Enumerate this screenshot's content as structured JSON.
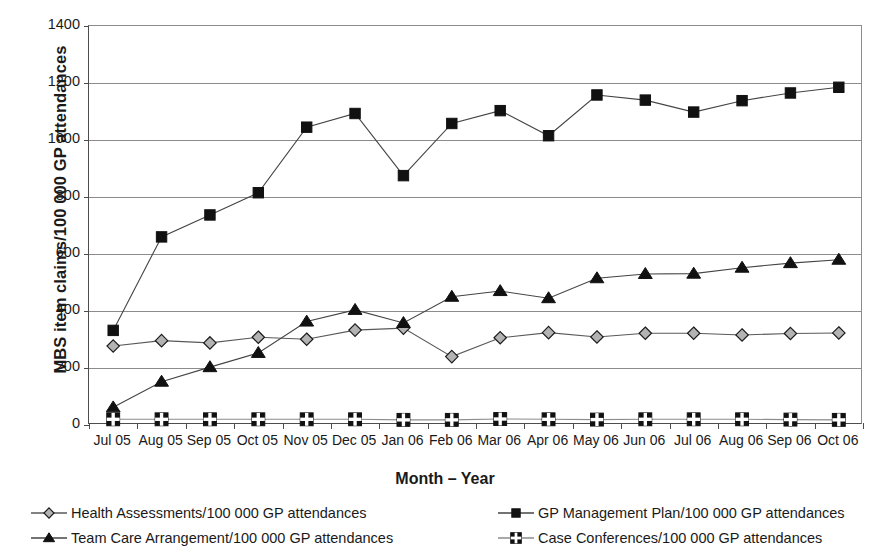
{
  "chart_data": {
    "type": "line",
    "title": "",
    "xlabel": "Month – Year",
    "ylabel": "MBS item claims/100 000 GP attendances",
    "ylim": [
      0,
      1400
    ],
    "ytick_step": 200,
    "yticks": [
      "0",
      "200",
      "400",
      "600",
      "800",
      "1000",
      "1200",
      "1400"
    ],
    "grid": "horizontal",
    "legend_position": "bottom",
    "categories": [
      "Jul 05",
      "Aug 05",
      "Sep 05",
      "Oct 05",
      "Nov 05",
      "Dec 05",
      "Jan 06",
      "Feb 06",
      "Mar 06",
      "Apr 06",
      "May 06",
      "Jun 06",
      "Jul 06",
      "Aug 06",
      "Sep 06",
      "Oct 06"
    ],
    "series": [
      {
        "name": "Health Assessments/100 000 GP attendances",
        "marker": "diamond",
        "marker_fill": "#b3b3b3",
        "marker_stroke": "#1a1a1a",
        "line_color": "#595959",
        "values": [
          277,
          296,
          288,
          308,
          301,
          333,
          340,
          240,
          306,
          324,
          309,
          322,
          322,
          316,
          321,
          323
        ]
      },
      {
        "name": "GP Management Plan/100 000 GP attendances",
        "marker": "square",
        "marker_fill": "#111111",
        "marker_stroke": "#111111",
        "line_color": "#444444",
        "values": [
          332,
          660,
          737,
          815,
          1045,
          1093,
          875,
          1058,
          1103,
          1015,
          1158,
          1140,
          1098,
          1138,
          1165,
          1185
        ]
      },
      {
        "name": "Team Care Arrangement/100 000 GP attendances",
        "marker": "triangle",
        "marker_fill": "#111111",
        "marker_stroke": "#111111",
        "line_color": "#444444",
        "values": [
          62,
          152,
          203,
          253,
          363,
          404,
          358,
          450,
          470,
          445,
          515,
          530,
          531,
          552,
          568,
          580
        ]
      },
      {
        "name": "Case Conferences/100 000 GP attendances",
        "marker": "plus-square",
        "marker_fill": "#111111",
        "marker_stroke": "#111111",
        "line_color": "#8c8c8c",
        "values": [
          20,
          20,
          20,
          20,
          20,
          20,
          18,
          18,
          21,
          20,
          19,
          20,
          20,
          20,
          19,
          18
        ]
      }
    ]
  },
  "legend": {
    "items": [
      "Health Assessments/100 000 GP attendances",
      "Team Care Arrangement/100 000 GP attendances",
      "GP Management Plan/100 000 GP attendances",
      "Case Conferences/100 000 GP attendances"
    ]
  }
}
